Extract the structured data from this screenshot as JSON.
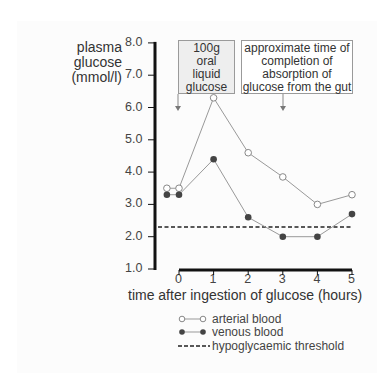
{
  "chart_data": {
    "type": "line",
    "title": "",
    "ylabel": "plasma glucose (mmol/l)",
    "xlabel": "time after ingestion of glucose (hours)",
    "ylim": [
      1.0,
      8.0
    ],
    "xlim": [
      0,
      5
    ],
    "y_ticks": [
      "1.0",
      "2.0",
      "3.0",
      "4.0",
      "5.0",
      "6.0",
      "7.0",
      "8.0"
    ],
    "x_ticks": [
      "0",
      "1",
      "2",
      "3",
      "4",
      "5"
    ],
    "x": [
      -0.35,
      0,
      1,
      2,
      3,
      4,
      5
    ],
    "series": [
      {
        "name": "arterial blood",
        "marker": "open-circle",
        "values": [
          3.5,
          3.5,
          6.3,
          4.6,
          3.85,
          3.0,
          3.3
        ]
      },
      {
        "name": "venous blood",
        "marker": "filled-circle",
        "values": [
          3.3,
          3.3,
          4.4,
          2.6,
          2.0,
          2.0,
          2.7
        ]
      }
    ],
    "reference_lines": [
      {
        "name": "hypoglycaemic threshold",
        "style": "dashed",
        "y": 2.3
      }
    ],
    "annotations": [
      {
        "text": "100g oral liquid glucose",
        "x": 0,
        "arrow": "down"
      },
      {
        "text": "approximate time of completion of absorption of glucose from the gut",
        "x": 3,
        "arrow": "down"
      }
    ],
    "grid": false,
    "legend_position": "bottom"
  },
  "labels": {
    "ylabel_lines": [
      "plasma",
      "glucose",
      "(mmol/l)"
    ],
    "xlabel": "time after ingestion of glucose  (hours)",
    "box1_lines": [
      "100g",
      "oral",
      "liquid",
      "glucose"
    ],
    "box2_lines": [
      "approximate time of",
      "completion of",
      "absorption of",
      "glucose from the gut"
    ],
    "legend": [
      "arterial blood",
      "venous blood",
      "hypoglycaemic threshold"
    ]
  },
  "colors": {
    "axis": "#111111",
    "line": "#999999",
    "venous_marker": "#444444",
    "threshold": "#222222",
    "box1_fill": "#eeeeee"
  }
}
